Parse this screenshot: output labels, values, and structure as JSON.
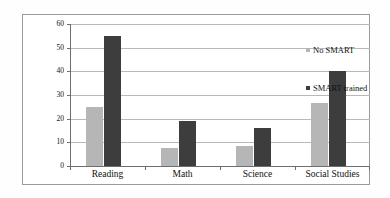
{
  "chart_data": {
    "type": "bar",
    "title": "",
    "subtitle": "",
    "xlabel": "",
    "ylabel": "",
    "categories": [
      "Reading",
      "Math",
      "Science",
      "Social Studies"
    ],
    "series": [
      {
        "name": "No SMART",
        "color": "#b6b6b6",
        "values": [
          25,
          7.5,
          8.5,
          26.5
        ]
      },
      {
        "name": "SMART trained",
        "color": "#3d3d3d",
        "values": [
          55,
          19,
          16,
          40
        ]
      }
    ],
    "ylim": [
      0,
      60
    ],
    "yticks": [
      0,
      10,
      20,
      30,
      40,
      50,
      60
    ],
    "ytick_labels": [
      "0",
      "10",
      "20",
      "30",
      "40",
      "50",
      "60"
    ],
    "grid": true,
    "grid_axis": "y",
    "legend_position": "right",
    "annotations": []
  },
  "legend": {
    "entries": [
      {
        "label": "No SMART",
        "swatch": "light"
      },
      {
        "label": "SMART trained",
        "swatch": "dark"
      }
    ]
  },
  "colors": {
    "series_light": "#b6b6b6",
    "series_dark": "#3d3d3d",
    "gridline": "#b9b9b9",
    "axis": "#6e6e6e",
    "frame": "#9a9a9a",
    "text": "#111111",
    "background": "#ffffff"
  }
}
